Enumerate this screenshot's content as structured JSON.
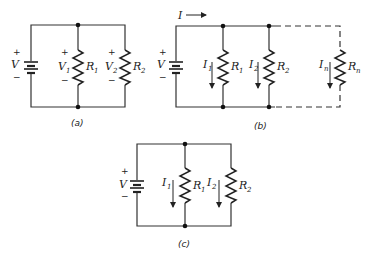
{
  "figure": {
    "panels": [
      {
        "id": "a",
        "caption": "(a)",
        "source": {
          "symbol": "V",
          "plus": "+",
          "minus": "−"
        },
        "resistors": [
          {
            "name": "R",
            "sub": "1",
            "voltage": "V",
            "voltage_sub": "1",
            "plus": "+",
            "minus": "−"
          },
          {
            "name": "R",
            "sub": "2",
            "voltage": "V",
            "voltage_sub": "2",
            "plus": "+",
            "minus": "−"
          }
        ]
      },
      {
        "id": "b",
        "caption": "(b)",
        "total_current": "I",
        "source": {
          "symbol": "V",
          "plus": "+",
          "minus": "−"
        },
        "resistors": [
          {
            "name": "R",
            "sub": "1",
            "current": "I",
            "current_sub": "1"
          },
          {
            "name": "R",
            "sub": "2",
            "current": "I",
            "current_sub": "2"
          },
          {
            "name": "R",
            "sub": "n",
            "current": "I",
            "current_sub": "n"
          }
        ]
      },
      {
        "id": "c",
        "caption": "(c)",
        "source": {
          "symbol": "V",
          "plus": "+",
          "minus": "−"
        },
        "resistors": [
          {
            "name": "R",
            "sub": "1",
            "current": "I",
            "current_sub": "1"
          },
          {
            "name": "R",
            "sub": "2",
            "current": "I",
            "current_sub": "2"
          }
        ]
      }
    ],
    "colors": {
      "line": "#333333",
      "background": "#ffffff"
    }
  }
}
